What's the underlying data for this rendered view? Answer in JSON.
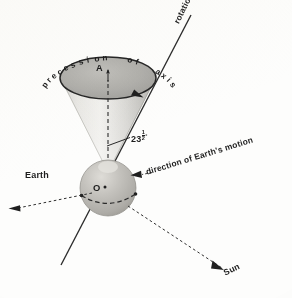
{
  "figure": {
    "background_color": "#fdfdfc",
    "ink_color": "#1d1d1d"
  },
  "labels": {
    "precession": "precession  of  axis",
    "rotation_axis": "rotation axis",
    "tilt_value": "23",
    "tilt_fraction_numerator": "1",
    "tilt_fraction_denominator": "2",
    "tilt_degree_symbol": "°",
    "earth_motion": "direction of  Earth's  motion",
    "earth": "Earth",
    "sun": "Sun",
    "cone_apex": "A",
    "earth_center": "O"
  },
  "elements": {
    "precession_cone": {
      "name": "precession-cone",
      "apex_x": 108,
      "apex_y": 172,
      "ellipse_cx": 108,
      "ellipse_cy": 78,
      "ellipse_rx": 48,
      "ellipse_ry": 21,
      "fill_light": "#e9e9e6",
      "fill_dark": "#b4b4b0"
    },
    "precession_ellipse": {
      "name": "precession-path-ellipse",
      "stroke": "#2a2a2a",
      "fill": "#a9a9a5",
      "arrow_direction": "clockwise"
    },
    "earth_globe": {
      "name": "earth-globe",
      "cx": 108,
      "cy": 188,
      "r": 28,
      "fill": "#b9b7b2",
      "highlight": "#d8d6d1"
    },
    "rotation_axis_line": {
      "name": "rotation-axis-line",
      "x1": 191,
      "y1": 15,
      "x2": 61,
      "y2": 265,
      "stroke": "#2d2d2d"
    },
    "precession_axis_dashed": {
      "name": "precession-axis-dashed-arrow",
      "x1": 108,
      "y1": 172,
      "x2": 108,
      "y2": 66,
      "stroke": "#2d2d2d",
      "dash": "4 3"
    },
    "equator_dashed": {
      "name": "equator-dashed-line",
      "stroke": "#2d2d2d",
      "dash": "4 3"
    },
    "orbit_arrow_left": {
      "name": "orbit-direction-arrow",
      "x1": 96,
      "y1": 192,
      "x2": 12,
      "y2": 210,
      "dash": "3 3"
    },
    "motion_arrow": {
      "name": "earth-motion-arrow",
      "x1": 150,
      "y1": 173,
      "x2": 132,
      "y2": 176
    },
    "sun_arrow": {
      "name": "sun-direction-arrow",
      "x1": 126,
      "y1": 206,
      "x2": 228,
      "y2": 272,
      "dash": "3 3"
    },
    "tilt_leader": {
      "name": "tilt-angle-leader-line",
      "x1": 129,
      "y1": 137,
      "x2": 108,
      "y2": 145
    }
  }
}
